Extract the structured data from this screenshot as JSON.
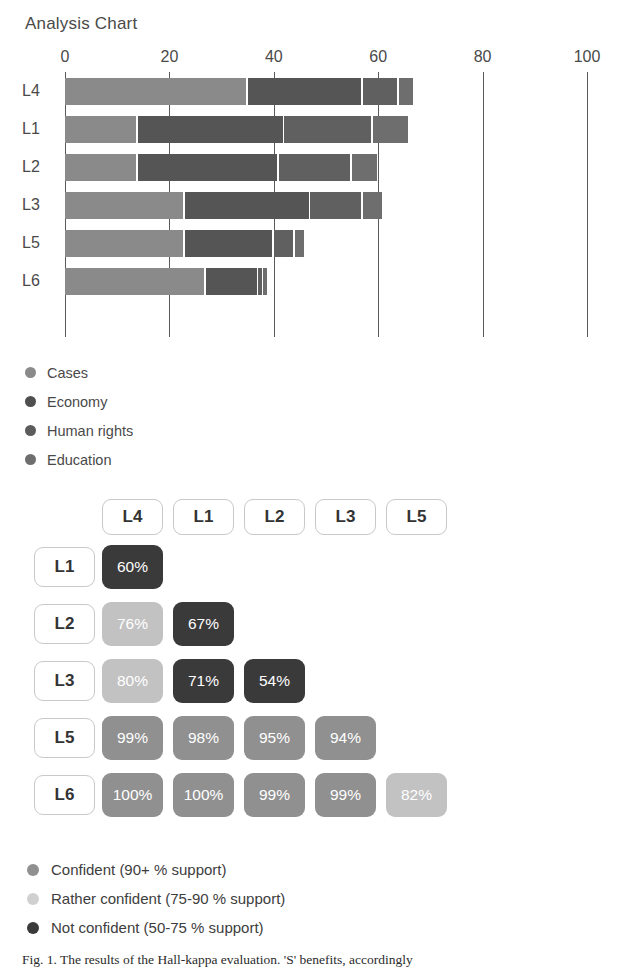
{
  "chart_data": [
    {
      "type": "bar",
      "title": "Analysis Chart",
      "orientation": "horizontal",
      "stacked": true,
      "xlabel": "",
      "ylabel": "",
      "xlim": [
        0,
        100
      ],
      "ticks": [
        0,
        20,
        40,
        60,
        80,
        100
      ],
      "tick_labels": [
        "0",
        "20",
        "40",
        "60",
        "80",
        "100"
      ],
      "grid": true,
      "legend_position": "below",
      "categories": [
        "L4",
        "L1",
        "L2",
        "L3",
        "L5",
        "L6"
      ],
      "series": [
        {
          "name": "Cases",
          "color": "#8a8a8a",
          "values": [
            35,
            14,
            14,
            23,
            23,
            27
          ]
        },
        {
          "name": "Economy",
          "color": "#555555",
          "values": [
            22,
            28,
            27,
            24,
            17,
            10
          ]
        },
        {
          "name": "Human rights",
          "color": "#606060",
          "values": [
            7,
            17,
            14,
            10,
            4,
            1
          ]
        },
        {
          "name": "Education",
          "color": "#6e6e6e",
          "values": [
            3,
            7,
            5,
            4,
            2,
            1
          ]
        }
      ],
      "totals": [
        67,
        66,
        60,
        61,
        46,
        39
      ]
    },
    {
      "type": "heatmap",
      "title": "",
      "columns": [
        "L4",
        "L1",
        "L2",
        "L3",
        "L5"
      ],
      "rows": [
        "L1",
        "L2",
        "L3",
        "L5",
        "L6"
      ],
      "cells": [
        [
          {
            "value": "60%",
            "level": "not"
          }
        ],
        [
          {
            "value": "76%",
            "level": "rather"
          },
          {
            "value": "67%",
            "level": "not"
          }
        ],
        [
          {
            "value": "80%",
            "level": "rather"
          },
          {
            "value": "71%",
            "level": "not"
          },
          {
            "value": "54%",
            "level": "not"
          }
        ],
        [
          {
            "value": "99%",
            "level": "confident"
          },
          {
            "value": "98%",
            "level": "confident"
          },
          {
            "value": "95%",
            "level": "confident"
          },
          {
            "value": "94%",
            "level": "confident"
          }
        ],
        [
          {
            "value": "100%",
            "level": "confident"
          },
          {
            "value": "100%",
            "level": "confident"
          },
          {
            "value": "99%",
            "level": "confident"
          },
          {
            "value": "99%",
            "level": "confident"
          },
          {
            "value": "82%",
            "level": "rather"
          }
        ]
      ],
      "level_colors": {
        "confident": "#909090",
        "rather": "#c2c2c2",
        "not": "#3a3a3a"
      },
      "legend": [
        {
          "label": "Confident (90+ % support)",
          "level": "confident",
          "color": "#909090"
        },
        {
          "label": "Rather confident (75-90 % support)",
          "level": "rather",
          "color": "#d0d0d0"
        },
        {
          "label": "Not confident (50-75 % support)",
          "level": "not",
          "color": "#3a3a3a"
        }
      ]
    }
  ],
  "title": {
    "text": "Analysis Chart"
  },
  "bar_legend": [
    {
      "label": "Cases",
      "color": "#8a8a8a"
    },
    {
      "label": "Economy",
      "color": "#4f4f4f"
    },
    {
      "label": "Human rights",
      "color": "#5c5c5c"
    },
    {
      "label": "Education",
      "color": "#6e6e6e"
    }
  ],
  "caption": {
    "text": "Fig. 1. The results of the Hall-kappa evaluation. 'S' benefits, accordingly"
  }
}
